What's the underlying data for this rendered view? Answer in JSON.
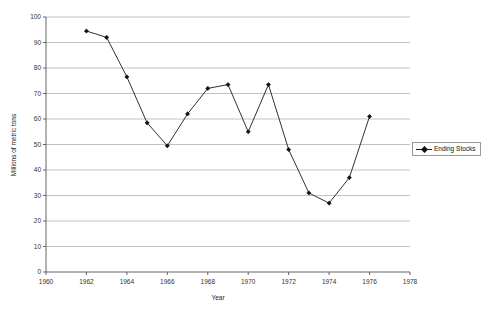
{
  "chart_data": {
    "type": "line",
    "title": "",
    "subtitle": "",
    "xlabel": "Year",
    "ylabel": "Millions of metric tons",
    "xlim": [
      1960,
      1978
    ],
    "ylim": [
      0,
      100
    ],
    "xticks": [
      1960,
      1962,
      1964,
      1966,
      1968,
      1970,
      1972,
      1974,
      1976,
      1978
    ],
    "yticks": [
      0,
      10,
      20,
      30,
      40,
      50,
      60,
      70,
      80,
      90,
      100
    ],
    "grid": "horizontal",
    "legend_position": "right",
    "marker": "diamond",
    "line_color": "#1a1a1a",
    "marker_color": "#111111",
    "grid_color": "#a9a9a9",
    "x": [
      1962,
      1963,
      1964,
      1965,
      1966,
      1967,
      1968,
      1969,
      1970,
      1971,
      1972,
      1973,
      1974,
      1975,
      1976
    ],
    "series": [
      {
        "name": "Ending Stocks",
        "values": [
          94.5,
          92.0,
          76.5,
          58.5,
          49.5,
          62.0,
          72.0,
          73.5,
          55.0,
          73.5,
          48.0,
          31.0,
          27.0,
          37.0,
          61.0
        ]
      }
    ]
  },
  "legend": {
    "entries": [
      {
        "label": "Ending Stocks",
        "marker": "diamond-marker"
      }
    ]
  },
  "axes": {
    "x_title": "Year",
    "y_title": "Millions of metric tons",
    "x_tick_labels": [
      "1960",
      "1962",
      "1964",
      "1966",
      "1968",
      "1970",
      "1972",
      "1974",
      "1976",
      "1978"
    ],
    "y_tick_labels": [
      "0",
      "10",
      "20",
      "30",
      "40",
      "50",
      "60",
      "70",
      "80",
      "90",
      "100"
    ]
  }
}
